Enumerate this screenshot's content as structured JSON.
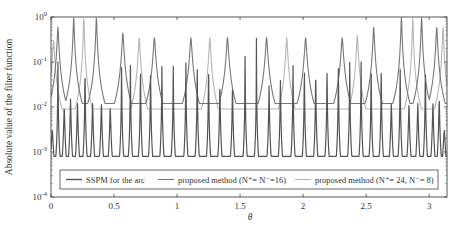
{
  "chart_data": {
    "type": "line",
    "title": "",
    "xlabel": "θ",
    "ylabel": "Absolute value of the filter function",
    "xlim": [
      0,
      3.1416
    ],
    "ylim": [
      0.0001,
      1
    ],
    "yscale": "log",
    "x_ticks": [
      0,
      0.5,
      1,
      1.5,
      2,
      2.5,
      3
    ],
    "x_tick_labels": [
      "0",
      "0.5",
      "1",
      "1.5",
      "2",
      "2.5",
      "3"
    ],
    "y_ticks": [
      1,
      0.1,
      0.01,
      0.001,
      0.0001
    ],
    "y_tick_labels": [
      {
        "base": "10",
        "exp": "0"
      },
      {
        "base": "10",
        "exp": "-1"
      },
      {
        "base": "10",
        "exp": "-2"
      },
      {
        "base": "10",
        "exp": "-3"
      },
      {
        "base": "10",
        "exp": "-4"
      }
    ],
    "grid": false,
    "legend_position": "lower center (inside)",
    "series": [
      {
        "name": "SSPM for the arc",
        "color": "#555555",
        "baseline": 0.0008,
        "width": 0.012,
        "peaks": [
          [
            0.01,
            0.003
          ],
          [
            0.055,
            0.1
          ],
          [
            0.105,
            0.01
          ],
          [
            0.155,
            0.015
          ],
          [
            0.21,
            0.012
          ],
          [
            0.27,
            0.1
          ],
          [
            0.33,
            0.012
          ],
          [
            0.4,
            0.012
          ],
          [
            0.47,
            0.01
          ],
          [
            0.56,
            0.1
          ],
          [
            0.63,
            0.1
          ],
          [
            0.71,
            0.11
          ],
          [
            0.79,
            0.08
          ],
          [
            0.88,
            0.1
          ],
          [
            0.97,
            0.08
          ],
          [
            1.07,
            0.1
          ],
          [
            1.16,
            0.09
          ],
          [
            1.25,
            0.1
          ],
          [
            1.34,
            0.035
          ],
          [
            1.44,
            0.03
          ],
          [
            1.54,
            1
          ],
          [
            1.63,
            1
          ],
          [
            1.73,
            0.03
          ],
          [
            1.82,
            0.04
          ],
          [
            1.92,
            0.1
          ],
          [
            2.01,
            0.09
          ],
          [
            2.1,
            0.08
          ],
          [
            2.19,
            0.1
          ],
          [
            2.28,
            0.09
          ],
          [
            2.37,
            0.1
          ],
          [
            2.46,
            0.12
          ],
          [
            2.54,
            0.11
          ],
          [
            2.62,
            0.1
          ],
          [
            2.7,
            0.012
          ],
          [
            2.77,
            0.1
          ],
          [
            2.84,
            0.012
          ],
          [
            2.91,
            0.012
          ],
          [
            2.97,
            0.1
          ],
          [
            3.03,
            0.012
          ],
          [
            3.08,
            0.015
          ],
          [
            3.12,
            0.003
          ]
        ]
      },
      {
        "name": "proposed method (N⁺= N⁻=16)",
        "color": "#777777",
        "baseline": 0.012,
        "width": 0.05,
        "peaks": [
          [
            0.055,
            0.6
          ],
          [
            0.18,
            1
          ],
          [
            0.36,
            1
          ],
          [
            0.57,
            0.45
          ],
          [
            0.82,
            0.35
          ],
          [
            1.11,
            0.35
          ],
          [
            1.4,
            0.35
          ],
          [
            1.71,
            0.35
          ],
          [
            2.02,
            0.35
          ],
          [
            2.31,
            0.35
          ],
          [
            2.56,
            0.6
          ],
          [
            2.78,
            1
          ],
          [
            2.94,
            1
          ],
          [
            3.06,
            0.6
          ]
        ]
      },
      {
        "name": "proposed method (N⁺= 24, N⁻= 8)",
        "color": "#b5b5b5",
        "baseline": 0.009,
        "width": 0.05,
        "peaks": [
          [
            0.02,
            0.3
          ],
          [
            0.26,
            1
          ],
          [
            0.7,
            0.35
          ],
          [
            1.26,
            0.35
          ],
          [
            1.87,
            0.35
          ],
          [
            2.43,
            0.4
          ],
          [
            2.87,
            1
          ],
          [
            3.11,
            0.6
          ]
        ]
      }
    ]
  },
  "legend": {
    "items": [
      {
        "label": "SSPM for the arc",
        "color": "#555555"
      },
      {
        "label": "proposed method (N⁺= N⁻=16)",
        "color": "#777777"
      },
      {
        "label": "proposed method (N⁺= 24, N⁻= 8)",
        "color": "#b5b5b5"
      }
    ]
  }
}
